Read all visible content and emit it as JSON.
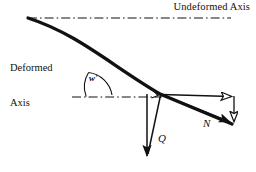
{
  "figure": {
    "type": "engineering-mechanics-diagram",
    "title_text": "Deformed beam axis with internal force components",
    "background_color": "#ffffff",
    "ink_color": "#111111",
    "labels": {
      "undeformed_axis": "Undeformed Axis",
      "deformed_axis_line1": "Deformed",
      "deformed_axis_line2": "Axis",
      "rotation_angle": "w'",
      "shear_force": "Q",
      "normal_force": "N"
    },
    "geometry": {
      "undeformed_axis_line": {
        "x1": 28,
        "y1": 18,
        "x2": 231,
        "y2": 18,
        "style": "dash-dot"
      },
      "reference_axis_line": {
        "x1": 72,
        "y1": 97,
        "x2": 163,
        "y2": 97,
        "style": "dash-dot"
      },
      "deformed_curve": {
        "start": [
          28,
          18
        ],
        "control1": [
          86,
          40
        ],
        "control2": [
          120,
          74
        ],
        "end": [
          232,
          125
        ],
        "stroke_width": 3.2
      },
      "angle_arc": {
        "vertex": [
          88,
          97
        ],
        "radius": 27,
        "from_deg": 180,
        "to_deg": 215
      },
      "right_angle_marker": {
        "at": [
          160,
          95
        ],
        "size": 8
      },
      "shear_arrow": {
        "x1": 147,
        "y1": 95,
        "x2": 147,
        "y2": 160,
        "head": "solid"
      },
      "shear_leader": {
        "x1": 161,
        "y1": 94,
        "x2": 147,
        "y2": 160
      },
      "normal_arrow": {
        "x1": 161,
        "y1": 94,
        "x2": 233,
        "y2": 124,
        "head": "solid"
      },
      "horizontal_component_arrow": {
        "x1": 161,
        "y1": 94,
        "x2": 236,
        "y2": 96,
        "head": "open"
      },
      "vertical_component_arrow": {
        "x1": 234,
        "y1": 96,
        "x2": 234,
        "y2": 126,
        "head": "open"
      }
    }
  }
}
